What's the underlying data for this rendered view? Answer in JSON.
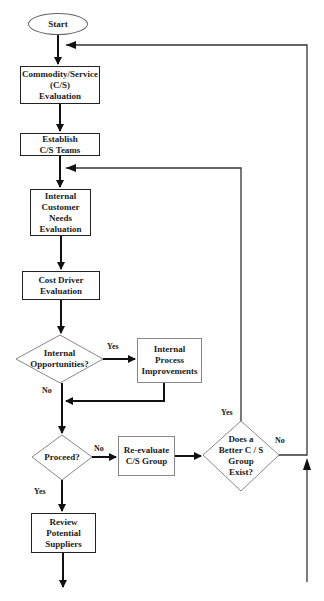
{
  "diagram": {
    "type": "flowchart",
    "nodes": {
      "start": {
        "label": "Start",
        "shape": "ellipse"
      },
      "commodity": {
        "label_lines": [
          "Commodity/Service",
          "(C/S)",
          "Evaluation"
        ],
        "shape": "rect"
      },
      "establish": {
        "label_lines": [
          "Establish",
          "C/S Teams"
        ],
        "shape": "rect"
      },
      "internal_customer": {
        "label_lines": [
          "Internal",
          "Customer",
          "Needs",
          "Evaluation"
        ],
        "shape": "rect"
      },
      "cost_driver": {
        "label_lines": [
          "Cost Driver",
          "Evaluation"
        ],
        "shape": "rect"
      },
      "internal_opps": {
        "label_lines": [
          "Internal",
          "Opportunities?"
        ],
        "shape": "diamond"
      },
      "internal_process": {
        "label_lines": [
          "Internal",
          "Process",
          "Improvements"
        ],
        "shape": "rect"
      },
      "proceed": {
        "label": "Proceed?",
        "shape": "diamond"
      },
      "reevaluate": {
        "label_lines": [
          "Re-evaluate",
          "C/S Group"
        ],
        "shape": "rect"
      },
      "better_group": {
        "label_lines": [
          "Does a",
          "Better C / S",
          "Group",
          "Exist?"
        ],
        "shape": "diamond"
      },
      "review": {
        "label_lines": [
          "Review",
          "Potential",
          "Suppliers"
        ],
        "shape": "rect"
      }
    },
    "edge_labels": {
      "opps_yes": "Yes",
      "opps_no": "No",
      "proceed_no": "No",
      "proceed_yes": "Yes",
      "better_yes": "Yes",
      "better_no": "No"
    },
    "edges": [
      {
        "from": "start",
        "to": "commodity"
      },
      {
        "from": "commodity",
        "to": "establish"
      },
      {
        "from": "establish",
        "to": "internal_customer"
      },
      {
        "from": "internal_customer",
        "to": "cost_driver"
      },
      {
        "from": "cost_driver",
        "to": "internal_opps"
      },
      {
        "from": "internal_opps",
        "to": "internal_process",
        "label": "Yes"
      },
      {
        "from": "internal_opps",
        "to": "proceed",
        "label": "No"
      },
      {
        "from": "internal_process",
        "to": "proceed"
      },
      {
        "from": "proceed",
        "to": "reevaluate",
        "label": "No"
      },
      {
        "from": "proceed",
        "to": "review",
        "label": "Yes"
      },
      {
        "from": "reevaluate",
        "to": "better_group"
      },
      {
        "from": "better_group",
        "to": "internal_customer",
        "label": "Yes"
      },
      {
        "from": "better_group",
        "to": "start",
        "label": "No"
      }
    ]
  }
}
